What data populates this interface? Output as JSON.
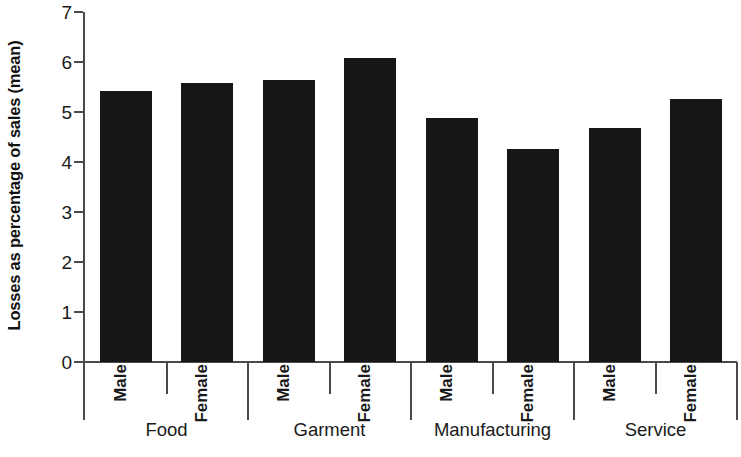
{
  "chart_data": {
    "type": "bar",
    "title": "",
    "subtitle": "",
    "xlabel": "",
    "ylabel": "Losses as percentage of sales (mean)",
    "ylim": [
      0,
      7
    ],
    "ytick_labels": [
      "7",
      "6",
      "5",
      "4",
      "3",
      "2",
      "1",
      "0"
    ],
    "ytick_values": [
      7,
      6,
      5,
      4,
      3,
      2,
      1,
      0
    ],
    "grid": false,
    "legend": null,
    "bar_color": "#161616",
    "axis_color": "#4a4a4a",
    "groups": [
      "Food",
      "Garment",
      "Manufacturing",
      "Service"
    ],
    "categories": [
      "Food - Male",
      "Food - Female",
      "Garment - Male",
      "Garment - Female",
      "Manufacturing - Male",
      "Manufacturing - Female",
      "Service - Male",
      "Service - Female"
    ],
    "subcategories": [
      "Male",
      "Female",
      "Male",
      "Female",
      "Male",
      "Female",
      "Male",
      "Female"
    ],
    "values": [
      5.42,
      5.58,
      5.64,
      6.08,
      4.88,
      4.26,
      4.69,
      5.26
    ],
    "series": [
      {
        "name": "Losses as percentage of sales (mean)",
        "values": [
          5.42,
          5.58,
          5.64,
          6.08,
          4.88,
          4.26,
          4.69,
          5.26
        ]
      }
    ],
    "bars": [
      {
        "group": "Food",
        "sub": "Male",
        "value": 5.42
      },
      {
        "group": "Food",
        "sub": "Female",
        "value": 5.58
      },
      {
        "group": "Garment",
        "sub": "Male",
        "value": 5.64
      },
      {
        "group": "Garment",
        "sub": "Female",
        "value": 6.08
      },
      {
        "group": "Manufacturing",
        "sub": "Male",
        "value": 4.88
      },
      {
        "group": "Manufacturing",
        "sub": "Female",
        "value": 4.26
      },
      {
        "group": "Service",
        "sub": "Male",
        "value": 4.69
      },
      {
        "group": "Service",
        "sub": "Female",
        "value": 5.26
      }
    ]
  }
}
